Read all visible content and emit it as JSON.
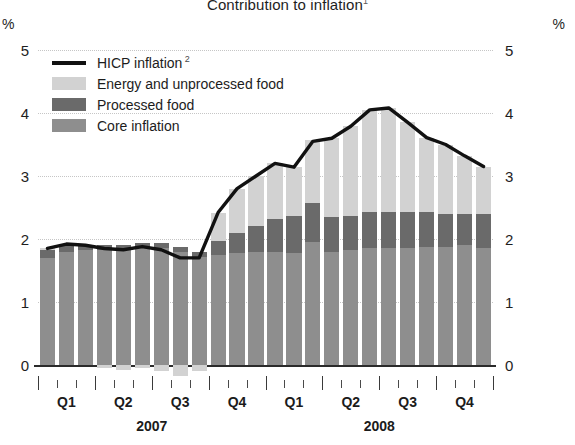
{
  "chart_data": {
    "type": "bar",
    "title": "Contribution to inflation",
    "title_footnote": "1",
    "xlabel": "",
    "ylabel": "",
    "unit_left": "%",
    "unit_right": "%",
    "ylim": [
      0,
      5
    ],
    "yticks": [
      0,
      1,
      2,
      3,
      4,
      5
    ],
    "ytick_labels_left": [
      "0",
      "1",
      "2",
      "3",
      "4",
      "5"
    ],
    "ytick_labels_right": [
      "0",
      "1",
      "2",
      "3",
      "4",
      "5"
    ],
    "grid": true,
    "legend_position": "upper left",
    "stacked": true,
    "x": [
      "2007-01",
      "2007-02",
      "2007-03",
      "2007-04",
      "2007-05",
      "2007-06",
      "2007-07",
      "2007-08",
      "2007-09",
      "2007-10",
      "2007-11",
      "2007-12",
      "2008-01",
      "2008-02",
      "2008-03",
      "2008-04",
      "2008-05",
      "2008-06",
      "2008-07",
      "2008-08",
      "2008-09",
      "2008-10",
      "2008-11",
      "2008-12"
    ],
    "categories": [
      "Jan 2007",
      "Feb 2007",
      "Mar 2007",
      "Apr 2007",
      "May 2007",
      "Jun 2007",
      "Jul 2007",
      "Aug 2007",
      "Sep 2007",
      "Oct 2007",
      "Nov 2007",
      "Dec 2007",
      "Jan 2008",
      "Feb 2008",
      "Mar 2008",
      "Apr 2008",
      "May 2008",
      "Jun 2008",
      "Jul 2008",
      "Aug 2008",
      "Sep 2008",
      "Oct 2008",
      "Nov 2008",
      "Dec 2008"
    ],
    "quarter_labels": [
      "Q1",
      "Q2",
      "Q3",
      "Q4",
      "Q1",
      "Q2",
      "Q3",
      "Q4"
    ],
    "year_labels": [
      "2007",
      "2008"
    ],
    "series": [
      {
        "name": "Core inflation",
        "color": "#8e8e8e",
        "values": [
          1.7,
          1.8,
          1.82,
          1.82,
          1.83,
          1.85,
          1.85,
          1.8,
          1.72,
          1.75,
          1.78,
          1.8,
          1.8,
          1.78,
          1.95,
          1.8,
          1.82,
          1.85,
          1.85,
          1.85,
          1.88,
          1.88,
          1.9,
          1.85
        ]
      },
      {
        "name": "Processed food",
        "color": "#6a6a6a",
        "values": [
          0.12,
          0.1,
          0.08,
          0.08,
          0.08,
          0.08,
          0.08,
          0.08,
          0.08,
          0.22,
          0.32,
          0.4,
          0.52,
          0.58,
          0.62,
          0.55,
          0.55,
          0.58,
          0.58,
          0.58,
          0.55,
          0.52,
          0.5,
          0.55
        ]
      },
      {
        "name": "Energy and unprocessed food",
        "color": "#d2d2d2",
        "values": [
          0.03,
          0.02,
          0.0,
          -0.05,
          -0.08,
          -0.05,
          -0.1,
          -0.18,
          -0.1,
          0.45,
          0.7,
          0.8,
          0.88,
          0.78,
          1.0,
          1.25,
          1.42,
          1.62,
          1.65,
          1.42,
          1.18,
          1.1,
          0.92,
          0.75
        ]
      }
    ],
    "line_series": {
      "name": "HICP inflation",
      "footnote": "2",
      "color": "#111111",
      "values": [
        1.85,
        1.92,
        1.9,
        1.85,
        1.83,
        1.88,
        1.83,
        1.7,
        1.7,
        2.42,
        2.8,
        3.0,
        3.2,
        3.14,
        3.55,
        3.6,
        3.79,
        4.05,
        4.08,
        3.85,
        3.61,
        3.5,
        3.32,
        3.15
      ]
    }
  },
  "legend": {
    "items": [
      {
        "label": "HICP inflation",
        "footnote": "2",
        "key": "line"
      },
      {
        "label": "Energy and unprocessed food",
        "footnote": "",
        "key": "energy"
      },
      {
        "label": "Processed food",
        "footnote": "",
        "key": "processed"
      },
      {
        "label": "Core inflation",
        "footnote": "",
        "key": "core"
      }
    ]
  }
}
